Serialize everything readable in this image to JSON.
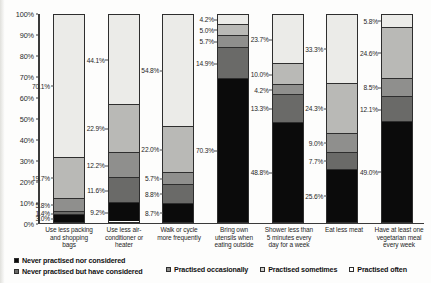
{
  "chart_data": {
    "type": "bar",
    "subtype": "stacked-bar-100-percent",
    "title": "",
    "xlabel": "",
    "ylabel": "",
    "ylim": [
      0,
      100
    ],
    "grid": false,
    "legend_position": "bottom",
    "y_ticks": [
      "0%",
      "10%",
      "20%",
      "30%",
      "40%",
      "50%",
      "60%",
      "70%",
      "80%",
      "90%",
      "100%"
    ],
    "categories": [
      "Use less packing and shopping bags",
      "Use less air-conditioner or heater",
      "Walk or cycle more frequently",
      "Bring own utensils when eating outside",
      "Shower less than 5 minutes every day for a week",
      "Eat less meat",
      "Have at least one vegetarian meal every week"
    ],
    "series": [
      {
        "name": "Never practised nor considered",
        "key": "never",
        "color": "#0b0b0b",
        "values": [
          3.0,
          9.2,
          8.7,
          70.3,
          48.8,
          25.6,
          49.0
        ],
        "labels": [
          "3.0%",
          "9.2%",
          "8.7%",
          "70.3%",
          "48.8%",
          "25.6%",
          "49.0%"
        ]
      },
      {
        "name": "Never practised but have considered",
        "key": "considered",
        "color": "#6a6a68",
        "values": [
          1.4,
          11.6,
          8.8,
          14.9,
          13.3,
          7.7,
          12.1
        ],
        "labels": [
          "1.4%",
          "11.6%",
          "8.8%",
          "14.9%",
          "13.3%",
          "7.7%",
          "12.1%"
        ]
      },
      {
        "name": "Practised occasionally",
        "key": "occasionally",
        "color": "#8f8f8d",
        "values": [
          5.8,
          12.2,
          5.7,
          5.7,
          4.2,
          9.0,
          8.5
        ],
        "labels": [
          "5.8%",
          "12.2%",
          "5.7%",
          "5.7%",
          "4.2%",
          "9.0%",
          "8.5%"
        ]
      },
      {
        "name": "Practised sometimes",
        "key": "sometimes",
        "color": "#b9b9b6",
        "values": [
          19.7,
          22.9,
          22.0,
          5.0,
          10.0,
          24.3,
          24.6
        ],
        "labels": [
          "19.7%",
          "22.9%",
          "22.0%",
          "5.0%",
          "10.0%",
          "24.3%",
          "24.6%"
        ]
      },
      {
        "name": "Practised often",
        "key": "often",
        "color": "#ebebe8",
        "values": [
          70.1,
          44.1,
          54.8,
          4.2,
          23.7,
          33.3,
          5.8
        ],
        "labels": [
          "70.1%",
          "44.1%",
          "54.8%",
          "4.2%",
          "23.7%",
          "33.3%",
          "5.8%"
        ]
      }
    ]
  },
  "legend": {
    "items": [
      {
        "label": "Never practised nor considered",
        "swatch": "sw-never"
      },
      {
        "label": "Never practised but have considered",
        "swatch": "sw-considered"
      },
      {
        "label": "Practised occasionally",
        "swatch": "sw-occasionally"
      },
      {
        "label": "Practised sometimes",
        "swatch": "sw-sometimes"
      },
      {
        "label": "Practised often",
        "swatch": "sw-often"
      }
    ]
  }
}
